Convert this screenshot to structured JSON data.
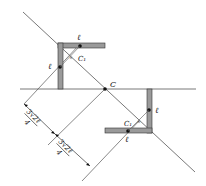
{
  "diagram": {
    "type": "geometry-figure",
    "labels": {
      "center": "C",
      "upper_center_of_mass": "C₁",
      "lower_center_of_mass": "C₁",
      "arm_length_upper_h": "ℓ",
      "arm_length_upper_v": "ℓ",
      "arm_length_lower_v": "ℓ",
      "arm_length_lower_h": "ℓ"
    },
    "dimensions": [
      {
        "numerator": "3√2ℓ",
        "denominator": "4"
      },
      {
        "numerator": "3√2ℓ",
        "denominator": "4"
      }
    ],
    "colors": {
      "line": "#555555",
      "bar_fill": "#9a9a9a",
      "bar_stroke": "#333333",
      "point": "#111111"
    }
  }
}
